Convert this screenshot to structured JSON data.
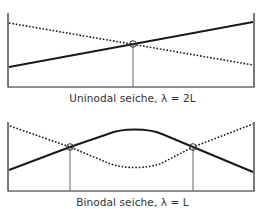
{
  "colors": {
    "background": "#ffffff",
    "line": "#1a1a1a",
    "basin": "#222222",
    "node_marker": "#555555",
    "caption": "#333333"
  },
  "panels": [
    {
      "id": "uninodal",
      "caption": "Uninodal seiche, λ = 2L",
      "nodes": 1,
      "basin": {
        "left_x": 8,
        "right_x": 254,
        "top_y": 13,
        "bottom_y": 87
      },
      "solid_surface": {
        "points": [
          [
            8,
            67
          ],
          [
            254,
            22
          ]
        ],
        "style": "solid"
      },
      "dotted_surface": {
        "points": [
          [
            8,
            23
          ],
          [
            254,
            65
          ]
        ],
        "style": "dotted"
      },
      "node_markers": [
        {
          "x": 133,
          "y": 44
        }
      ]
    },
    {
      "id": "binodal",
      "caption": "Binodal seiche, λ = L",
      "nodes": 2,
      "basin": {
        "left_x": 8,
        "right_x": 254,
        "top_y": 122,
        "bottom_y": 191
      },
      "solid_surface": {
        "style": "solid",
        "peak": {
          "x": 135,
          "y": 129
        },
        "start_y": 170,
        "end_y": 172
      },
      "dotted_surface": {
        "style": "dotted",
        "trough": {
          "x": 135,
          "y": 168
        },
        "start_y": 126,
        "end_y": 124
      },
      "node_markers": [
        {
          "x": 70,
          "y": 147
        },
        {
          "x": 193,
          "y": 147
        }
      ]
    }
  ]
}
